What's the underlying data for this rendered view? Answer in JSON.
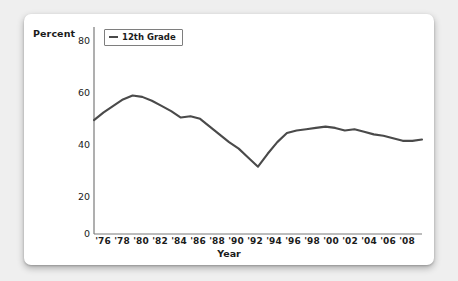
{
  "chart_data": {
    "type": "line",
    "title": "",
    "xlabel": "Year",
    "ylabel": "Percent",
    "ylim": [
      0,
      80
    ],
    "xlim": [
      1975,
      2009
    ],
    "yticks": [
      "0",
      "20",
      "40",
      "60",
      "80"
    ],
    "ytick_values": [
      0,
      20,
      40,
      60,
      80
    ],
    "xticks": [
      "'76",
      "'78",
      "'80",
      "'82",
      "'84",
      "'86",
      "'88",
      "'90",
      "'92",
      "'94",
      "'96",
      "'98",
      "'00",
      "'02",
      "'04",
      "'06",
      "'08"
    ],
    "xtick_values": [
      1976,
      1978,
      1980,
      1982,
      1984,
      1986,
      1988,
      1990,
      1992,
      1994,
      1996,
      1998,
      2000,
      2002,
      2004,
      2006,
      2008
    ],
    "grid": false,
    "legend_position": "upper-left",
    "series": [
      {
        "name": "12th Grade",
        "color": "#4a4a4a",
        "x": [
          1975,
          1976,
          1977,
          1978,
          1979,
          1980,
          1981,
          1982,
          1983,
          1984,
          1985,
          1986,
          1987,
          1988,
          1989,
          1990,
          1991,
          1992,
          1993,
          1994,
          1995,
          1996,
          1997,
          1998,
          1999,
          2000,
          2001,
          2002,
          2003,
          2004,
          2005,
          2006,
          2007,
          2008,
          2009
        ],
        "values": [
          44.0,
          47.0,
          49.5,
          52.0,
          53.5,
          53.0,
          51.5,
          49.5,
          47.5,
          45.0,
          45.5,
          44.5,
          41.5,
          38.5,
          35.5,
          33.0,
          29.5,
          26.0,
          31.0,
          35.5,
          39.0,
          40.0,
          40.5,
          41.0,
          41.5,
          41.0,
          40.0,
          40.5,
          39.5,
          38.5,
          38.0,
          37.0,
          36.0,
          36.0,
          36.5
        ]
      }
    ]
  },
  "axis_titles": {
    "y": "Percent",
    "x": "Year"
  },
  "legend": {
    "items": [
      {
        "label": "12th Grade",
        "swatch": "line-swatch"
      }
    ]
  }
}
